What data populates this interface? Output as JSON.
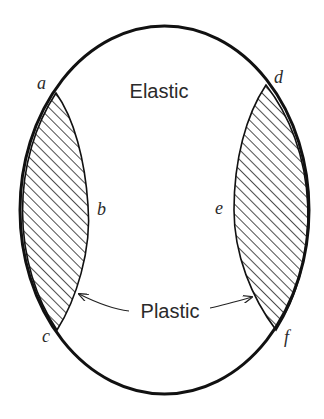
{
  "diagram": {
    "type": "stress-region-diagram",
    "shape": "ellipse",
    "colors": {
      "stroke": "#111111",
      "hatch": "#222222",
      "text": "#2a2a2a",
      "background": "#ffffff"
    },
    "regions": {
      "elastic": {
        "label": "Elastic"
      },
      "plastic": {
        "label": "Plastic"
      }
    },
    "points": {
      "a": "a",
      "b": "b",
      "c": "c",
      "d": "d",
      "e": "e",
      "f": "f"
    }
  }
}
